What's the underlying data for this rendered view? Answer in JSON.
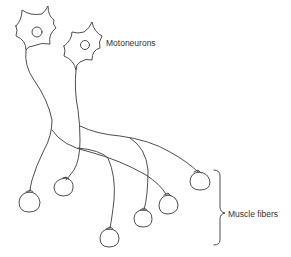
{
  "diagram": {
    "labels": {
      "motoneurons": "Motoneurons",
      "muscle_fibers": "Muscle fibers"
    },
    "colors": {
      "stroke": "#3a3a3a",
      "background": "#ffffff",
      "text": "#333333"
    },
    "neurons": [
      {
        "id": "motoneuron-1",
        "cx": 36,
        "cy": 32
      },
      {
        "id": "motoneuron-2",
        "cx": 84,
        "cy": 47
      }
    ],
    "muscle_fibers": [
      {
        "cx": 29,
        "cy": 201
      },
      {
        "cx": 63,
        "cy": 187
      },
      {
        "cx": 109,
        "cy": 238
      },
      {
        "cx": 143,
        "cy": 217
      },
      {
        "cx": 176,
        "cy": 205
      },
      {
        "cx": 200,
        "cy": 180
      }
    ]
  }
}
